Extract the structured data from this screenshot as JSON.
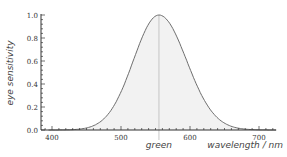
{
  "chart_data": {
    "type": "area",
    "title": "",
    "xlabel": "wavelength / nm",
    "ylabel": "eye sensitivity",
    "xlim": [
      385,
      730
    ],
    "ylim": [
      0,
      1.0
    ],
    "x_ticks": [
      400,
      500,
      600,
      700
    ],
    "y_ticks": [
      0.0,
      0.2,
      0.4,
      0.6,
      0.8,
      1.0
    ],
    "y_tick_labels": [
      "0.0",
      "0.2",
      "0.4",
      "0.6",
      "0.8",
      "1.0"
    ],
    "x_tick_labels": [
      "400",
      "500",
      "600",
      "700"
    ],
    "grid": false,
    "legend": null,
    "series": [
      {
        "name": "eye sensitivity",
        "x": [
          400,
          420,
          440,
          460,
          480,
          500,
          520,
          540,
          555,
          570,
          590,
          610,
          630,
          650,
          670,
          690,
          710
        ],
        "values": [
          0.0,
          0.01,
          0.04,
          0.1,
          0.21,
          0.38,
          0.62,
          0.9,
          1.0,
          0.95,
          0.76,
          0.5,
          0.27,
          0.11,
          0.04,
          0.01,
          0.0
        ]
      }
    ],
    "annotations": [
      {
        "text": "green",
        "x": 555,
        "type": "vertical-line"
      }
    ],
    "peak": {
      "x": 555,
      "y": 1.0
    },
    "colors": {
      "curve": "#6e6e6e",
      "fill": "#f2f2f2",
      "axis": "#333333",
      "marker_line": "#bbbbbb"
    }
  }
}
